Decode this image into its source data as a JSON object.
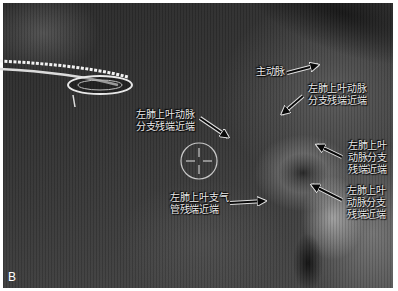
{
  "figure": {
    "panel_label": "B"
  },
  "annotations": [
    {
      "id": "aorta",
      "text": "主动脉"
    },
    {
      "id": "lul-artery-stump-top",
      "text": "左肺上叶动脉\n分支残端近端"
    },
    {
      "id": "lul-artery-stump-left",
      "text": "左肺上叶动脉\n分支残端近端"
    },
    {
      "id": "lul-artery-stump-right-upper",
      "text": "左肺上叶\n动脉分支\n残端近端"
    },
    {
      "id": "lul-bronchus-stump",
      "text": "左肺上叶支气\n管残端近端"
    },
    {
      "id": "lul-artery-stump-right-lower",
      "text": "左肺上叶\n动脉分支\n残端近端"
    }
  ],
  "colors": {
    "label_text": "#e9e9e9",
    "arrow_fill": "#0a0a0a",
    "arrow_outline": "#e0e0e0",
    "border": "#ffffff"
  }
}
